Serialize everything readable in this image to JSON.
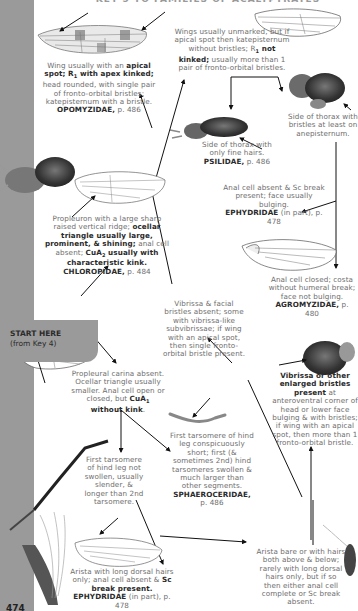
{
  "header": {
    "title": "KEY 5 TO FAMILIES OF ACALYPTRATES"
  },
  "start": {
    "label": "START HERE",
    "sub": "(from Key 4)"
  },
  "page_number": "474",
  "nodes": {
    "opomyzidae": {
      "pre": "Wing usually with an ",
      "b1": "apical spot; R",
      "sub1": "1",
      "b2": " with apex kinked;",
      "post": " head rounded, with single pair of fronto-orbital bristles; katepisternum with a bristle.",
      "family": "OPOMYZIDAE,",
      "page": " p. 486"
    },
    "wings_unmarked": {
      "pre": "Wings usually unmarked, but if apical spot then katepisternum without bristles; R",
      "sub": "1",
      "b": " not kinked;",
      "post": " usually more than 1 pair of fronto-orbital bristles."
    },
    "psilidae": {
      "text": "Side of thorax with only fine hairs.",
      "family": "PSILIDAE,",
      "page": " p. 486"
    },
    "anepisternum": {
      "text": "Side of thorax with bristles at least on anepisternum."
    },
    "ephydridae_1": {
      "text": "Anal cell absent & Sc break present; face usually bulging.",
      "family": "EPHYDRIDAE",
      "page": " (in part), p. 478"
    },
    "agromyzidae": {
      "text": "Anal cell closed; costa without humeral break; face not bulging.",
      "family": "AGROMYZIDAE,",
      "page": " p. 480"
    },
    "chloropidae": {
      "pre": "Propleuron with a large sharp raised vertical ridge; ",
      "b1": "ocellar triangle usually large, prominent, & shining;",
      "mid": " anal cell absent; ",
      "b2": "CuA",
      "sub": "2",
      "b3": " usually with characteristic kink.",
      "family": "CHLOROPIDAE,",
      "page": " p. 484"
    },
    "vibrissa_absent": {
      "text": "Vibrissa & facial bristles absent; some with vibrissa-like subvibrissae; if wing with an apical spot, then single fronto-orbital bristle present."
    },
    "vibrissa_present": {
      "b": "Vibrissa or other enlarged bristles present",
      "post": " at anteroventral corner of head or lower face bulging & with bristles; if wing with an apical spot, then more than 1 fronto-orbital bristle."
    },
    "propleural_absent": {
      "pre": "Propleural carina absent. Ocellar triangle usually smaller. Anal cell open or closed, but ",
      "b": "CuA",
      "sub": "1",
      "b2": " without kink",
      "post": "."
    },
    "tarsomere_long": {
      "text": "First tarsomere of hind leg not swollen, usually slender, & longer than 2nd tarsomere."
    },
    "sphaeroceridae": {
      "text": "First tarsomere of hind leg conspicuously short; first (& sometimes 2nd) hind tarsomeres swollen & much larger than other segments.",
      "family": "SPHAEROCERIDAE,",
      "page": "p. 486"
    },
    "ephydridae_2": {
      "pre": "Arista with long dorsal hairs only; anal cell absent & ",
      "b": "Sc break present.",
      "family": "EPHYDRIDAE",
      "page": " (in part), p. 478"
    },
    "arista_bare": {
      "text": "Arista bare or with hairs both above & below; rarely with long dorsal hairs only, but if so then either anal cell complete or Sc break absent."
    }
  },
  "illustrations": [
    "opomyzid-wing",
    "unmarked-wing",
    "psilid-fly",
    "thorax-bristles",
    "chloropid-fly",
    "chloropid-wing",
    "agromyzid-wing",
    "vibrissa-head",
    "start-wing",
    "hind-leg",
    "sphaerocerid-leg",
    "arista-antenna",
    "ephydrid-wing",
    "arista-bare-antenna"
  ]
}
